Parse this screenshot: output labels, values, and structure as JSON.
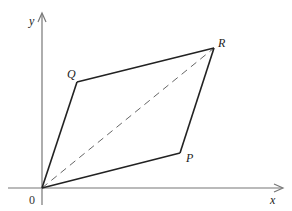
{
  "diagram": {
    "type": "vector-parallelogram",
    "axes": {
      "x_label": "x",
      "y_label": "y",
      "origin_label": "0",
      "color": "#777777"
    },
    "points": {
      "O": {
        "label": "0",
        "x": 42,
        "y": 188
      },
      "P": {
        "label": "P",
        "x": 180,
        "y": 153
      },
      "Q": {
        "label": "Q",
        "x": 77,
        "y": 82
      },
      "R": {
        "label": "R",
        "x": 214,
        "y": 48
      }
    },
    "edges": [
      {
        "from": "O",
        "to": "P",
        "style": "solid"
      },
      {
        "from": "O",
        "to": "Q",
        "style": "solid"
      },
      {
        "from": "Q",
        "to": "R",
        "style": "solid"
      },
      {
        "from": "P",
        "to": "R",
        "style": "solid"
      },
      {
        "from": "O",
        "to": "R",
        "style": "dashed"
      }
    ],
    "colors": {
      "edge": "#222222",
      "diagonal": "#666666",
      "axis": "#777777"
    }
  }
}
